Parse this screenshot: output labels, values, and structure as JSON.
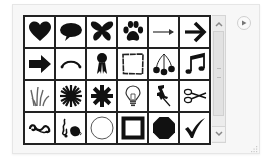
{
  "gallery": {
    "title": "Symbol gallery",
    "columns": 6,
    "rows": 4,
    "items": [
      {
        "name": "heart",
        "row": 1,
        "col": 1
      },
      {
        "name": "speech-bubble",
        "row": 1,
        "col": 2
      },
      {
        "name": "butterfly",
        "row": 1,
        "col": 3
      },
      {
        "name": "paw-print",
        "row": 1,
        "col": 4
      },
      {
        "name": "thin-arrow-right",
        "row": 1,
        "col": 5
      },
      {
        "name": "bold-arrow-right",
        "row": 1,
        "col": 6
      },
      {
        "name": "block-arrow-right",
        "row": 2,
        "col": 1
      },
      {
        "name": "arc-connector",
        "row": 2,
        "col": 2
      },
      {
        "name": "award-ribbon",
        "row": 2,
        "col": 3
      },
      {
        "name": "rough-frame",
        "row": 2,
        "col": 4
      },
      {
        "name": "cherries",
        "row": 2,
        "col": 5
      },
      {
        "name": "music-notes",
        "row": 2,
        "col": 6
      },
      {
        "name": "grass",
        "row": 3,
        "col": 1
      },
      {
        "name": "starburst",
        "row": 3,
        "col": 2
      },
      {
        "name": "snowflake",
        "row": 3,
        "col": 3
      },
      {
        "name": "light-bulb",
        "row": 3,
        "col": 4
      },
      {
        "name": "push-pin",
        "row": 3,
        "col": 5
      },
      {
        "name": "scissors",
        "row": 3,
        "col": 6
      },
      {
        "name": "swirl-ornament",
        "row": 4,
        "col": 1
      },
      {
        "name": "floral-ornament",
        "row": 4,
        "col": 2
      },
      {
        "name": "circle-outline",
        "row": 4,
        "col": 3
      },
      {
        "name": "square-frame",
        "row": 4,
        "col": 4
      },
      {
        "name": "octagon",
        "row": 4,
        "col": 5
      },
      {
        "name": "checkmark",
        "row": 4,
        "col": 6
      }
    ]
  },
  "scrollbar": {
    "up_icon": "chevron-up-icon",
    "down_icon": "chevron-down-icon"
  },
  "flyout": {
    "icon": "play-triangle-icon"
  },
  "colors": {
    "grid_line": "#222222",
    "icon_fill": "#111111",
    "panel_bg": "#f7f7f7",
    "scrollbar_bg": "#ececec"
  }
}
